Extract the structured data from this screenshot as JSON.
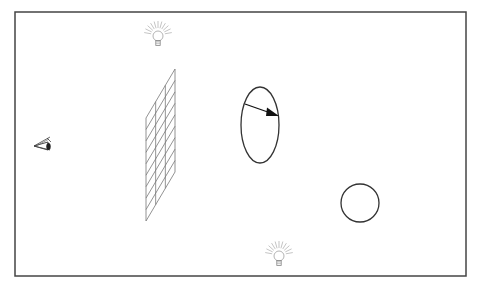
{
  "diagram": {
    "elements": [
      {
        "id": "eye",
        "kind": "camera-eye",
        "label": ""
      },
      {
        "id": "image-plane",
        "kind": "grid",
        "columns": 3,
        "rows": 9,
        "label": ""
      },
      {
        "id": "ellipse-object",
        "kind": "ellipse",
        "label": "",
        "has_arrow": true
      },
      {
        "id": "sphere-object",
        "kind": "circle",
        "label": ""
      },
      {
        "id": "light-top",
        "kind": "light-bulb",
        "label": ""
      },
      {
        "id": "light-bottom",
        "kind": "light-bulb",
        "label": ""
      }
    ]
  },
  "colors": {
    "frame": "#444444",
    "grid": "#777777",
    "shape": "#333333",
    "arrow": "#111111",
    "bulb": "#aaaaaa",
    "background": "#ffffff"
  }
}
